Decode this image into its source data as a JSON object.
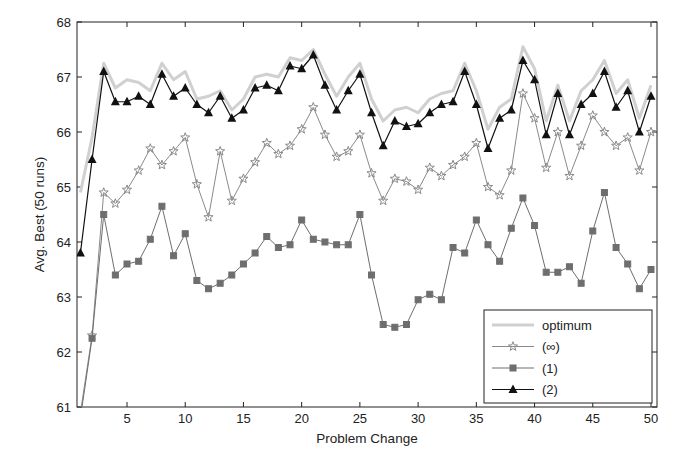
{
  "chart_data": {
    "type": "line",
    "title": "",
    "xlabel": "Problem Change",
    "ylabel": "Avg. Best (50 runs)",
    "xlim": [
      0.7,
      50.6
    ],
    "ylim": [
      61,
      68
    ],
    "xticks": [
      5,
      10,
      15,
      20,
      25,
      30,
      35,
      40,
      45,
      50
    ],
    "yticks": [
      61,
      62,
      63,
      64,
      65,
      66,
      67,
      68
    ],
    "grid": false,
    "legend_position": "lower right",
    "x": [
      1,
      2,
      3,
      4,
      5,
      6,
      7,
      8,
      9,
      10,
      11,
      12,
      13,
      14,
      15,
      16,
      17,
      18,
      19,
      20,
      21,
      22,
      23,
      24,
      25,
      26,
      27,
      28,
      29,
      30,
      31,
      32,
      33,
      34,
      35,
      36,
      37,
      38,
      39,
      40,
      41,
      42,
      43,
      44,
      45,
      46,
      47,
      48,
      49,
      50
    ],
    "series": [
      {
        "name": "optimum",
        "color": "#d0d0d0",
        "marker": "none",
        "width": 3,
        "values": [
          64.9,
          65.9,
          67.25,
          66.8,
          66.95,
          66.9,
          66.75,
          67.25,
          66.95,
          67.1,
          66.6,
          66.65,
          66.75,
          66.4,
          66.6,
          67.0,
          67.05,
          67.0,
          67.35,
          67.3,
          67.5,
          67.05,
          66.65,
          67.0,
          67.25,
          66.6,
          66.2,
          66.4,
          66.45,
          66.35,
          66.6,
          66.7,
          66.75,
          67.25,
          66.75,
          66.05,
          66.45,
          66.6,
          67.55,
          67.15,
          66.2,
          66.85,
          66.2,
          66.75,
          66.95,
          67.3,
          66.7,
          66.95,
          66.25,
          66.85
        ]
      },
      {
        "name": "(∞)",
        "color": "#8a8a8a",
        "marker": "star",
        "width": 1,
        "values": [
          60.9,
          62.3,
          64.9,
          64.7,
          64.95,
          65.3,
          65.7,
          65.4,
          65.65,
          65.9,
          65.05,
          64.45,
          65.65,
          64.75,
          65.15,
          65.45,
          65.8,
          65.6,
          65.75,
          66.05,
          66.45,
          65.95,
          65.55,
          65.65,
          65.95,
          65.25,
          64.75,
          65.15,
          65.1,
          64.95,
          65.35,
          65.2,
          65.4,
          65.55,
          65.8,
          65.0,
          64.85,
          65.3,
          66.7,
          66.25,
          65.35,
          66.0,
          65.2,
          65.75,
          66.3,
          66.0,
          65.75,
          65.9,
          65.3,
          66.0
        ]
      },
      {
        "name": "(1)",
        "color": "#6e6e6e",
        "marker": "square",
        "width": 1,
        "values": [
          60.8,
          62.25,
          64.5,
          63.4,
          63.6,
          63.65,
          64.05,
          64.65,
          63.75,
          64.15,
          63.3,
          63.15,
          63.25,
          63.4,
          63.6,
          63.8,
          64.1,
          63.9,
          63.95,
          64.4,
          64.05,
          64.0,
          63.95,
          63.95,
          64.5,
          63.4,
          62.5,
          62.45,
          62.5,
          62.95,
          63.05,
          62.95,
          63.9,
          63.8,
          64.4,
          63.95,
          63.65,
          64.25,
          64.8,
          64.3,
          63.45,
          63.45,
          63.55,
          63.25,
          64.2,
          64.9,
          63.9,
          63.6,
          63.15,
          63.5
        ]
      },
      {
        "name": "(2)",
        "color": "#111111",
        "marker": "triangle",
        "width": 1.2,
        "values": [
          63.8,
          65.5,
          67.1,
          66.55,
          66.55,
          66.65,
          66.5,
          67.05,
          66.65,
          66.8,
          66.5,
          66.35,
          66.65,
          66.25,
          66.4,
          66.8,
          66.85,
          66.75,
          67.2,
          67.15,
          67.4,
          66.85,
          66.4,
          66.75,
          67.05,
          66.35,
          65.75,
          66.2,
          66.1,
          66.15,
          66.35,
          66.5,
          66.55,
          67.1,
          66.5,
          65.7,
          66.25,
          66.4,
          67.3,
          66.95,
          65.95,
          66.7,
          65.95,
          66.5,
          66.7,
          67.1,
          66.45,
          66.75,
          66.0,
          66.65
        ]
      }
    ]
  },
  "plot": {
    "left": 77,
    "right": 657,
    "top": 22,
    "bottom": 407,
    "x_at_5": 127,
    "x_at_50": 651
  }
}
